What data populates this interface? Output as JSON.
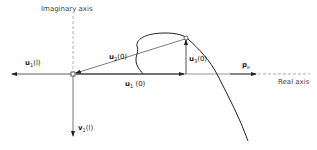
{
  "diagram": {
    "axes": {
      "imaginary_label": "Imaginary axis",
      "real_label": "Real axis"
    },
    "vectors": [
      {
        "id": "u1_l",
        "base": "u",
        "sub": "1",
        "arg": "(l)",
        "direction": "left"
      },
      {
        "id": "u2_0",
        "base": "u",
        "sub": "2",
        "arg": "(0)",
        "direction": "toward-origin"
      },
      {
        "id": "u3_0",
        "base": "u",
        "sub": "3",
        "arg": "(0)",
        "direction": "up"
      },
      {
        "id": "u1_0",
        "base": "u",
        "sub": "1",
        "arg": "(0)",
        "direction": "right"
      },
      {
        "id": "v1_l",
        "base": "v",
        "sub": "1",
        "arg": "(l)",
        "direction": "down"
      },
      {
        "id": "pe",
        "base": "p",
        "sub": "e",
        "arg": "",
        "direction": "right"
      }
    ],
    "colors": {
      "line": "#222222",
      "axis": "#888888",
      "dashed": "#999999"
    }
  }
}
